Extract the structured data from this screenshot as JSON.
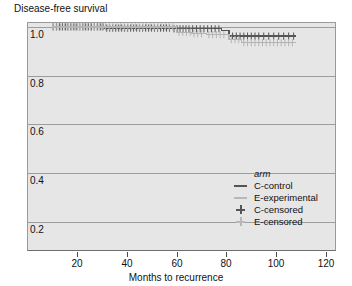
{
  "chart_data": {
    "type": "line",
    "subtype": "kaplan-meier-step",
    "title": "Disease-free survival",
    "xlabel": "Months to recurrence",
    "ylabel": "",
    "xlim": [
      0,
      124
    ],
    "ylim": [
      0.08,
      1.02
    ],
    "xticks": [
      20,
      40,
      60,
      80,
      100,
      120
    ],
    "yticks": [
      1.0,
      0.8,
      0.6,
      0.4,
      0.2
    ],
    "ytick_labels": [
      "1.0",
      "0.8",
      "0.6",
      "0.4",
      "0.2"
    ],
    "xtick_labels": [
      "20",
      "40",
      "60",
      "80",
      "100",
      "120"
    ],
    "grid": true,
    "grid_axis": "y",
    "legend_position": "lower right",
    "legend_title": "arm",
    "plot_bgcolor": "#e6e6e6",
    "series": [
      {
        "name": "C-control",
        "color": "#555555",
        "style": "step",
        "points": [
          [
            10.0,
            1.0
          ],
          [
            31.0,
            1.0
          ],
          [
            31.0,
            0.995
          ],
          [
            58.0,
            0.995
          ],
          [
            58.0,
            0.992
          ],
          [
            78.0,
            0.992
          ],
          [
            78.0,
            0.985
          ],
          [
            81.0,
            0.985
          ],
          [
            81.0,
            0.962
          ],
          [
            108.0,
            0.962
          ]
        ],
        "censored_times": [
          10.5,
          11.8,
          13.0,
          14.2,
          15.5,
          16.4,
          17.6,
          18.8,
          20.0,
          21.2,
          22.4,
          23.4,
          24.6,
          25.8,
          27.0,
          28.2,
          29.4,
          30.5,
          32.0,
          33.2,
          34.4,
          35.6,
          36.8,
          38.0,
          39.2,
          40.4,
          41.6,
          42.8,
          44.0,
          45.2,
          46.4,
          47.6,
          48.8,
          50.0,
          51.2,
          52.4,
          53.6,
          54.8,
          56.0,
          57.2,
          59.0,
          60.2,
          61.4,
          62.6,
          63.8,
          65.0,
          66.5,
          68.0,
          69.5,
          71.0,
          72.5,
          74.0,
          75.5,
          77.0,
          82.5,
          84.0,
          85.5,
          87.0,
          88.5,
          90.0,
          91.5,
          93.0,
          95.0,
          97.0,
          99.0,
          101.0,
          103.0,
          105.0,
          107.0
        ]
      },
      {
        "name": "E-experimental",
        "color": "#b4b4b4",
        "style": "step",
        "points": [
          [
            10.0,
            1.0
          ],
          [
            60.0,
            1.0
          ],
          [
            60.0,
            0.978
          ],
          [
            66.0,
            0.978
          ],
          [
            66.0,
            0.972
          ],
          [
            72.0,
            0.972
          ],
          [
            72.0,
            0.968
          ],
          [
            81.0,
            0.968
          ],
          [
            81.0,
            0.948
          ],
          [
            86.0,
            0.948
          ],
          [
            86.0,
            0.935
          ],
          [
            108.0,
            0.935
          ]
        ],
        "censored_times": [
          10.5,
          12.0,
          13.5,
          15.0,
          16.5,
          18.0,
          19.5,
          21.0,
          22.5,
          24.0,
          25.5,
          27.0,
          28.5,
          30.0,
          31.5,
          33.0,
          34.5,
          36.0,
          37.5,
          39.0,
          40.5,
          42.0,
          43.5,
          45.0,
          46.5,
          48.0,
          49.5,
          51.0,
          52.5,
          54.0,
          55.5,
          57.0,
          58.5,
          61.0,
          62.5,
          64.0,
          65.5,
          67.0,
          68.5,
          70.0,
          73.0,
          74.5,
          76.0,
          77.5,
          79.0,
          82.0,
          83.5,
          85.0,
          87.0,
          88.5,
          90.0,
          91.5,
          93.0,
          94.5,
          96.0,
          97.5,
          99.0,
          100.5,
          102.0,
          103.5,
          105.0,
          106.5
        ]
      }
    ],
    "legend_entries": [
      {
        "label": "C-control",
        "marker": "line",
        "color": "#555555"
      },
      {
        "label": "E-experimental",
        "marker": "line",
        "color": "#b8b8b8"
      },
      {
        "label": "C-censored",
        "marker": "plus",
        "color": "#555555"
      },
      {
        "label": "E-censored",
        "marker": "plus",
        "color": "#b8b8b8"
      }
    ]
  }
}
